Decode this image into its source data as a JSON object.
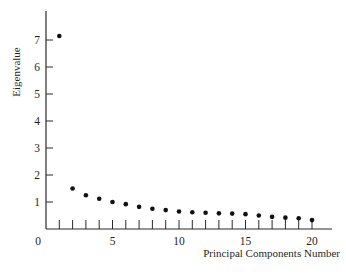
{
  "chart_data": {
    "type": "scatter",
    "title": "",
    "xlabel": "Principal Components Number",
    "ylabel": "Eigenvalue",
    "x": [
      1,
      2,
      3,
      4,
      5,
      6,
      7,
      8,
      9,
      10,
      11,
      12,
      13,
      14,
      15,
      16,
      17,
      18,
      19,
      20
    ],
    "y": [
      7.15,
      1.5,
      1.25,
      1.12,
      1.0,
      0.92,
      0.82,
      0.75,
      0.7,
      0.65,
      0.62,
      0.6,
      0.58,
      0.57,
      0.55,
      0.5,
      0.45,
      0.42,
      0.4,
      0.33
    ],
    "xlim": [
      0,
      21.5
    ],
    "ylim": [
      0,
      8
    ],
    "x_ticks": [
      0,
      5,
      10,
      15,
      20
    ],
    "x_minor_ticks": [
      1,
      2,
      3,
      4,
      5,
      6,
      7,
      8,
      9,
      10,
      11,
      12,
      13,
      14,
      15,
      16,
      17,
      18,
      19,
      20
    ],
    "y_ticks": [
      1,
      2,
      3,
      4,
      5,
      6,
      7
    ],
    "grid": false,
    "legend": null
  },
  "labels": {
    "xlabel": "Principal Components Number",
    "ylabel": "Eigenvalue",
    "x_tick_labels": [
      "0",
      "5",
      "10",
      "15",
      "20"
    ],
    "y_tick_labels": [
      "1",
      "2",
      "3",
      "4",
      "5",
      "6",
      "7"
    ]
  }
}
